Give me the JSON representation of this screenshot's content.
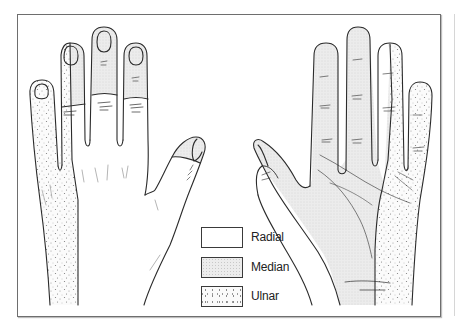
{
  "figure": {
    "views": [
      {
        "name": "dorsal",
        "position": "left"
      },
      {
        "name": "palmar",
        "position": "right"
      }
    ]
  },
  "legend": {
    "items": [
      {
        "label": "Radial",
        "pattern": "blank"
      },
      {
        "label": "Median",
        "pattern": "fine-stipple"
      },
      {
        "label": "Ulnar",
        "pattern": "coarse-dots"
      }
    ]
  },
  "colors": {
    "outline": "#2b2b2b",
    "frame": "#6e6e6e",
    "median_fill": "#ececec",
    "ulnar_dots": "#8a8a8a",
    "radial_fill": "#ffffff"
  }
}
